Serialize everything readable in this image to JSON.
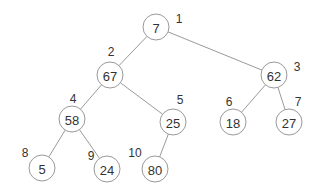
{
  "diagram": {
    "type": "binary-heap-tree",
    "node_radius": 13,
    "nodes": [
      {
        "index": "1",
        "value": "7",
        "x": 156,
        "y": 27,
        "lx": 179,
        "ly": 19
      },
      {
        "index": "2",
        "value": "67",
        "x": 110,
        "y": 75,
        "lx": 111,
        "ly": 52
      },
      {
        "index": "3",
        "value": "62",
        "x": 274,
        "y": 75,
        "lx": 297,
        "ly": 67
      },
      {
        "index": "4",
        "value": "58",
        "x": 72,
        "y": 119,
        "lx": 73,
        "ly": 99
      },
      {
        "index": "5",
        "value": "25",
        "x": 173,
        "y": 122,
        "lx": 180,
        "ly": 100
      },
      {
        "index": "6",
        "value": "18",
        "x": 233,
        "y": 122,
        "lx": 229,
        "ly": 102
      },
      {
        "index": "7",
        "value": "27",
        "x": 289,
        "y": 122,
        "lx": 298,
        "ly": 102
      },
      {
        "index": "8",
        "value": "5",
        "x": 42,
        "y": 168,
        "lx": 25,
        "ly": 153
      },
      {
        "index": "9",
        "value": "24",
        "x": 107,
        "y": 169,
        "lx": 91,
        "ly": 156
      },
      {
        "index": "10",
        "value": "80",
        "x": 155,
        "y": 169,
        "lx": 135,
        "ly": 153
      }
    ],
    "edges": [
      [
        0,
        1
      ],
      [
        0,
        2
      ],
      [
        1,
        3
      ],
      [
        1,
        4
      ],
      [
        2,
        5
      ],
      [
        2,
        6
      ],
      [
        3,
        7
      ],
      [
        3,
        8
      ],
      [
        4,
        9
      ]
    ],
    "colors": {
      "stroke": "#9a9a9a",
      "text": "#333333",
      "background": "#ffffff"
    }
  }
}
